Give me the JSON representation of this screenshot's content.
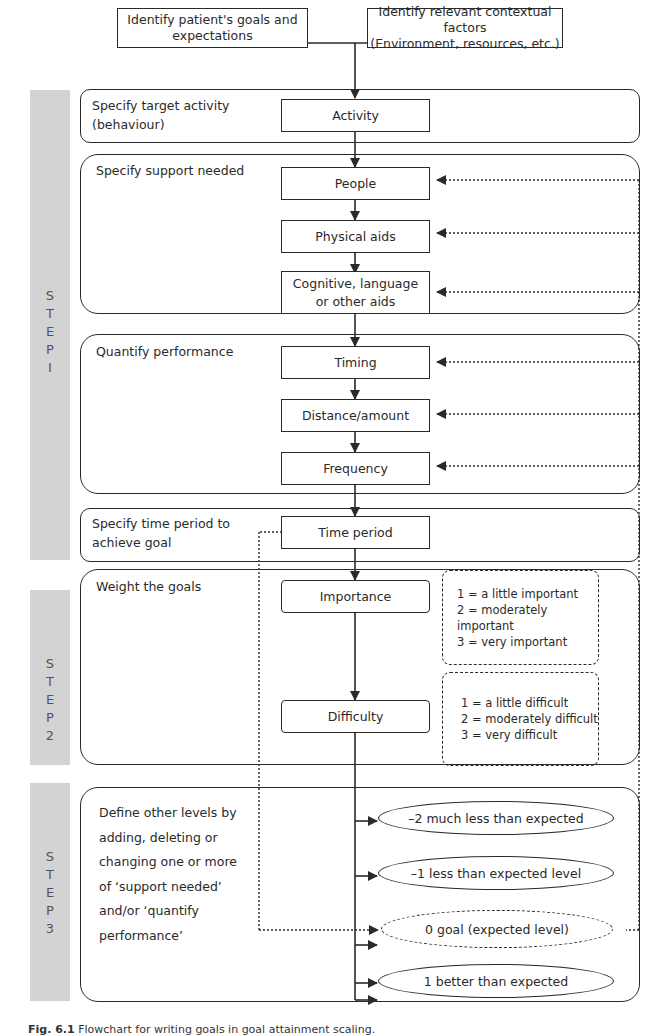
{
  "top": {
    "patient_goals": "Identify patient's goals and expectations",
    "contextual_factors_line1": "Identify relevant contextual factors",
    "contextual_factors_line2": "(Environment, resources, etc.)"
  },
  "steps": [
    {
      "label": "S T E P 1",
      "letters": [
        "S",
        "T",
        "E",
        "P",
        "I"
      ]
    },
    {
      "label": "S T E P 2",
      "letters": [
        "S",
        "T",
        "E",
        "P",
        "2"
      ]
    },
    {
      "label": "S T E P 3",
      "letters": [
        "S",
        "T",
        "E",
        "P",
        "3"
      ]
    }
  ],
  "sections": {
    "target_activity": {
      "label_line1": "Specify target activity",
      "label_line2": "(behaviour)",
      "boxes": [
        "Activity"
      ]
    },
    "support_needed": {
      "label": "Specify support needed",
      "boxes": [
        "People",
        "Physical aids",
        "Cognitive, language",
        "or other aids"
      ]
    },
    "quantify_performance": {
      "label": "Quantify performance",
      "boxes": [
        "Timing",
        "Distance/amount",
        "Frequency"
      ]
    },
    "time_period": {
      "label_line1": "Specify time period to",
      "label_line2": "achieve goal",
      "boxes": [
        "Time period"
      ]
    },
    "weight_goals": {
      "label": "Weight the goals",
      "boxes": [
        "Importance",
        "Difficulty"
      ],
      "importance_scale": [
        "1 = a little important",
        "2 = moderately important",
        "3 = very important"
      ],
      "difficulty_scale": [
        "1 = a little difficult",
        "2 = moderately difficult",
        "3 = very difficult"
      ]
    },
    "define_levels": {
      "label_lines": [
        "Define other levels by",
        "adding, deleting or",
        "changing one or more",
        "of ‘support needed’",
        "and/or ‘quantify",
        "performance’"
      ],
      "levels": [
        "–2 much less than expected",
        "–1 less than expected level",
        "0 goal (expected level)",
        "1 better than expected",
        "2 much better than expected"
      ]
    }
  },
  "caption": {
    "fig": "Fig. 6.1",
    "text": "Flowchart for writing goals in goal attainment scaling."
  }
}
